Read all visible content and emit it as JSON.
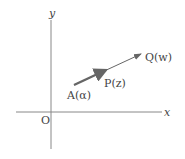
{
  "diagram": {
    "type": "complex-plane-vector",
    "colors": {
      "axis": "#888888",
      "vector": "#666666",
      "text": "#444444"
    },
    "axes": {
      "x_label": "x",
      "y_label": "y",
      "origin_label": "O"
    },
    "points": [
      {
        "name": "A",
        "label": "A(α)"
      },
      {
        "name": "P",
        "label": "P(z)"
      },
      {
        "name": "Q",
        "label": "Q(w)"
      }
    ]
  }
}
